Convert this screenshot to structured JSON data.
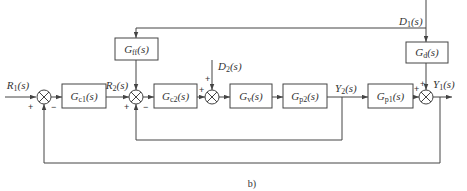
{
  "diagram": {
    "caption": "b)",
    "signals": {
      "r1": {
        "main": "R",
        "sub": "1",
        "arg": "(s)"
      },
      "r2": {
        "main": "R",
        "sub": "2",
        "arg": "(s)"
      },
      "d1": {
        "main": "D",
        "sub": "1",
        "arg": "(s)"
      },
      "d2": {
        "main": "D",
        "sub": "2",
        "arg": "(s)"
      },
      "y1": {
        "main": "Y",
        "sub": "1",
        "arg": "(s)"
      },
      "y2": {
        "main": "Y",
        "sub": "2",
        "arg": "(s)"
      }
    },
    "blocks": {
      "gc1": {
        "main": "G",
        "sub": "c1",
        "arg": "(s)"
      },
      "gc2": {
        "main": "G",
        "sub": "c2",
        "arg": "(s)"
      },
      "gv": {
        "main": "G",
        "sub": "v",
        "arg": "(s)"
      },
      "gp2": {
        "main": "G",
        "sub": "p2",
        "arg": "(s)"
      },
      "gp1": {
        "main": "G",
        "sub": "p1",
        "arg": "(s)"
      },
      "gff": {
        "main": "G",
        "sub": "ff",
        "arg": "(s)"
      },
      "gd": {
        "main": "G",
        "sub": "d",
        "arg": "(s)"
      }
    },
    "signs": {
      "sum1_ref": "+",
      "sum1_fb": "−",
      "sum2_ff": "+",
      "sum2_ref": "+",
      "sum2_fb": "−",
      "sum3_in": "+",
      "sum3_dist": "+",
      "sum4_in": "+",
      "sum4_dist": "+"
    },
    "colors": {
      "line": "#444444",
      "text": "#333333"
    }
  }
}
